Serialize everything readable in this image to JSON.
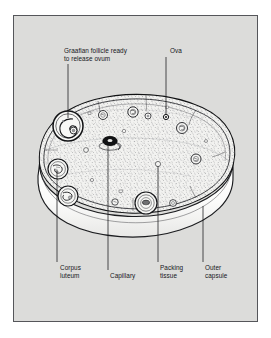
{
  "figure": {
    "background_color": "#dcdcda",
    "frame_color": "#55565a",
    "ink_color": "#16171a"
  },
  "labels": {
    "graafian_follicle": "Graafian follicle ready\nto release ovum",
    "ova": "Ova",
    "corpus_luteum": "Corpus\nluteum",
    "capillary": "Capillary",
    "packing_tissue": "Packing\ntissue",
    "outer_capsule": "Outer\ncapsule"
  },
  "leaders": {
    "graafian_follicle": {
      "x": 68,
      "from_y": 64,
      "to_y": 118
    },
    "ova": {
      "x": 166,
      "from_y": 57,
      "to_y": 116
    },
    "corpus_luteum": {
      "x": 57,
      "from_y": 262,
      "to_y": 168
    },
    "capillary": {
      "x": 108,
      "from_y": 270,
      "to_y": 146
    },
    "packing_tissue": {
      "x": 158,
      "from_y": 262,
      "to_y": 165
    },
    "outer_capsule": {
      "x": 203,
      "from_y": 262,
      "to_y": 205
    }
  },
  "structures": {
    "graafian_follicle": {
      "cx": 68,
      "cy": 126,
      "r": 15
    },
    "capillary_node": {
      "cx": 110,
      "cy": 141,
      "rx": 7,
      "ry": 4.5
    },
    "corpus_luteum_upper": {
      "cx": 58,
      "cy": 169,
      "r": 10
    },
    "corpus_luteum_lower": {
      "cx": 68,
      "cy": 196,
      "r": 10
    },
    "packing_tissue_follicle": {
      "cx": 146,
      "cy": 203,
      "r": 11
    },
    "ova_point": {
      "cx": 166,
      "cy": 117,
      "r": 2.6
    },
    "small_follicles": [
      {
        "cx": 103,
        "cy": 115,
        "r": 4.5
      },
      {
        "cx": 133,
        "cy": 112,
        "r": 5.2
      },
      {
        "cx": 148,
        "cy": 116,
        "r": 3.0
      },
      {
        "cx": 182,
        "cy": 128,
        "r": 5.5
      },
      {
        "cx": 196,
        "cy": 159,
        "r": 5.0
      },
      {
        "cx": 115,
        "cy": 202,
        "r": 3.2
      },
      {
        "cx": 173,
        "cy": 203,
        "r": 3.4
      },
      {
        "cx": 86,
        "cy": 150,
        "r": 2.4
      },
      {
        "cx": 158,
        "cy": 164,
        "r": 2.6
      }
    ]
  }
}
